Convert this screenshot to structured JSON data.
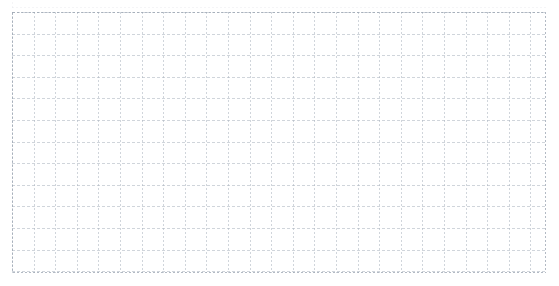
{
  "page": {
    "background_color": "#ffffff",
    "width": 559,
    "height": 286
  },
  "grid": {
    "name": "dotted-graph-paper",
    "origin_x": 12,
    "origin_y": 12,
    "width": 534,
    "height": 261,
    "cell_size": 21.6,
    "columns": 24,
    "rows": 12,
    "line_color": "#aab2bd",
    "line_opacity": 0.55,
    "horizontal_line_style": "dashed",
    "vertical_line_style": "dotted",
    "horizontal_dash_pattern": "3 2",
    "vertical_dash_pattern": "2 2",
    "stroke_width": 1,
    "border_color": "#9aa3b0",
    "border_style": "dotted",
    "content": ""
  },
  "top_sliver": {
    "name": "clipped-grid-row",
    "visible": true,
    "opacity": 0.45,
    "line_color": "#96a0af"
  },
  "chart_data": {
    "type": "table",
    "title": "",
    "xlabel": "",
    "ylabel": "",
    "categories": [],
    "values": [],
    "series": [],
    "annotations": [],
    "legend": [],
    "grid": true,
    "note": "Empty graph-paper grid with no plotted data, labels, ticks, or legend."
  }
}
